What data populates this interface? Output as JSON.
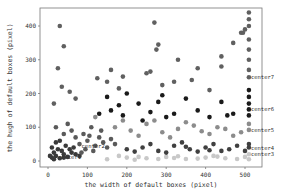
{
  "chart_data": {
    "type": "scatter",
    "title": "",
    "xlabel": "the width of default boxes (pixel)",
    "ylabel": "the hugh of default boxes (pixel)",
    "xlim": [
      -20,
      550
    ],
    "ylim": [
      -15,
      455
    ],
    "xticks": [
      0,
      100,
      200,
      300,
      400,
      500
    ],
    "yticks": [
      0,
      100,
      200,
      300,
      400
    ],
    "grid": false,
    "legend": "none",
    "annotations": [
      {
        "text": "center1",
        "x": 20,
        "y": 12
      },
      {
        "text": "center2",
        "x": 80,
        "y": 45
      },
      {
        "text": "center3",
        "x": 510,
        "y": 22
      },
      {
        "text": "center4",
        "x": 510,
        "y": 40
      },
      {
        "text": "center5",
        "x": 510,
        "y": 92
      },
      {
        "text": "center6",
        "x": 510,
        "y": 153
      },
      {
        "text": "center7",
        "x": 510,
        "y": 248
      }
    ],
    "series": [
      {
        "name": "cluster-1",
        "color": "#3a3a3a",
        "points": [
          [
            10,
            10
          ],
          [
            20,
            15
          ],
          [
            30,
            8
          ],
          [
            15,
            25
          ],
          [
            40,
            20
          ],
          [
            25,
            35
          ],
          [
            50,
            12
          ],
          [
            35,
            30
          ],
          [
            60,
            25
          ],
          [
            10,
            40
          ],
          [
            45,
            45
          ],
          [
            20,
            55
          ],
          [
            55,
            35
          ],
          [
            30,
            60
          ],
          [
            70,
            20
          ],
          [
            5,
            15
          ],
          [
            65,
            40
          ],
          [
            40,
            10
          ],
          [
            80,
            15
          ],
          [
            15,
            5
          ]
        ]
      },
      {
        "name": "cluster-2",
        "color": "#5a5a5a",
        "points": [
          [
            80,
            50
          ],
          [
            100,
            60
          ],
          [
            120,
            45
          ],
          [
            90,
            80
          ],
          [
            140,
            55
          ],
          [
            60,
            90
          ],
          [
            110,
            100
          ],
          [
            130,
            70
          ],
          [
            150,
            40
          ],
          [
            70,
            70
          ],
          [
            95,
            35
          ],
          [
            160,
            65
          ],
          [
            40,
            80
          ],
          [
            20,
            100
          ],
          [
            50,
            110
          ],
          [
            170,
            50
          ],
          [
            115,
            30
          ],
          [
            135,
            90
          ],
          [
            85,
            25
          ],
          [
            105,
            75
          ]
        ]
      },
      {
        "name": "cluster-3",
        "color": "#c8c8c8",
        "points": [
          [
            150,
            5
          ],
          [
            200,
            10
          ],
          [
            250,
            8
          ],
          [
            300,
            12
          ],
          [
            350,
            6
          ],
          [
            400,
            10
          ],
          [
            450,
            8
          ],
          [
            500,
            12
          ],
          [
            510,
            5
          ],
          [
            180,
            15
          ],
          [
            230,
            12
          ],
          [
            280,
            6
          ],
          [
            330,
            14
          ],
          [
            380,
            7
          ],
          [
            430,
            13
          ],
          [
            480,
            6
          ],
          [
            510,
            20
          ],
          [
            220,
            4
          ],
          [
            320,
            9
          ],
          [
            420,
            15
          ]
        ]
      },
      {
        "name": "cluster-4",
        "color": "#404040",
        "points": [
          [
            200,
            35
          ],
          [
            240,
            40
          ],
          [
            280,
            30
          ],
          [
            320,
            45
          ],
          [
            360,
            35
          ],
          [
            400,
            40
          ],
          [
            440,
            30
          ],
          [
            480,
            45
          ],
          [
            510,
            40
          ],
          [
            260,
            50
          ],
          [
            300,
            25
          ],
          [
            340,
            55
          ],
          [
            380,
            28
          ],
          [
            420,
            50
          ],
          [
            460,
            35
          ],
          [
            500,
            30
          ],
          [
            510,
            50
          ],
          [
            220,
            28
          ],
          [
            350,
            42
          ],
          [
            410,
            32
          ]
        ]
      },
      {
        "name": "cluster-5",
        "color": "#8c8c8c",
        "points": [
          [
            170,
            100
          ],
          [
            210,
            90
          ],
          [
            250,
            110
          ],
          [
            290,
            85
          ],
          [
            330,
            95
          ],
          [
            370,
            105
          ],
          [
            410,
            80
          ],
          [
            450,
            95
          ],
          [
            490,
            85
          ],
          [
            510,
            92
          ],
          [
            230,
            75
          ],
          [
            270,
            120
          ],
          [
            310,
            70
          ],
          [
            350,
            115
          ],
          [
            390,
            88
          ],
          [
            430,
            100
          ],
          [
            470,
            75
          ],
          [
            510,
            110
          ],
          [
            190,
            120
          ],
          [
            120,
            130
          ]
        ]
      },
      {
        "name": "cluster-6",
        "color": "#1a1a1a",
        "points": [
          [
            130,
            140
          ],
          [
            160,
            150
          ],
          [
            190,
            135
          ],
          [
            230,
            170
          ],
          [
            260,
            145
          ],
          [
            290,
            195
          ],
          [
            320,
            140
          ],
          [
            350,
            185
          ],
          [
            380,
            150
          ],
          [
            410,
            130
          ],
          [
            440,
            175
          ],
          [
            470,
            140
          ],
          [
            510,
            153
          ],
          [
            510,
            170
          ],
          [
            510,
            190
          ],
          [
            510,
            135
          ],
          [
            200,
            200
          ],
          [
            240,
            120
          ],
          [
            280,
            175
          ],
          [
            150,
            190
          ],
          [
            510,
            210
          ],
          [
            455,
            135
          ],
          [
            180,
            165
          ],
          [
            300,
            130
          ]
        ]
      },
      {
        "name": "cluster-7",
        "color": "#606060",
        "points": [
          [
            30,
            400
          ],
          [
            40,
            340
          ],
          [
            25,
            275
          ],
          [
            35,
            220
          ],
          [
            55,
            205
          ],
          [
            70,
            185
          ],
          [
            15,
            170
          ],
          [
            270,
            410
          ],
          [
            280,
            345
          ],
          [
            275,
            330
          ],
          [
            250,
            260
          ],
          [
            260,
            265
          ],
          [
            290,
            225
          ],
          [
            330,
            300
          ],
          [
            320,
            235
          ],
          [
            365,
            240
          ],
          [
            380,
            275
          ],
          [
            410,
            210
          ],
          [
            440,
            310
          ],
          [
            470,
            350
          ],
          [
            490,
            380
          ],
          [
            500,
            390
          ],
          [
            510,
            420
          ],
          [
            510,
            440
          ],
          [
            510,
            400
          ],
          [
            510,
            360
          ],
          [
            510,
            330
          ],
          [
            510,
            300
          ],
          [
            510,
            270
          ],
          [
            510,
            248
          ],
          [
            495,
            380
          ],
          [
            440,
            280
          ],
          [
            180,
            215
          ],
          [
            190,
            250
          ],
          [
            160,
            270
          ],
          [
            125,
            245
          ],
          [
            150,
            235
          ]
        ]
      }
    ]
  },
  "axes": {
    "x_tick_labels": [
      "0",
      "100",
      "200",
      "300",
      "400",
      "500"
    ],
    "y_tick_labels": [
      "0",
      "100",
      "200",
      "300",
      "400"
    ]
  }
}
